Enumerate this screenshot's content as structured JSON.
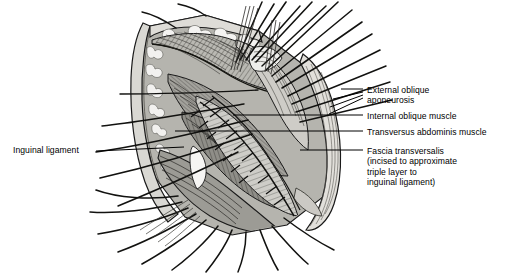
{
  "figure": {
    "kind": "medical-illustration",
    "background_color": "#ffffff",
    "line_color": "#1a1a1a",
    "tones": {
      "lightest": "#f0efed",
      "light": "#dededa",
      "mid_light": "#c6c5c0",
      "mid": "#aaa9a3",
      "mid_dark": "#8e8d87",
      "dark": "#6e6d68",
      "darkest": "#4a4945"
    }
  },
  "labels": {
    "external_oblique": {
      "line1": "External oblique",
      "line2": "aponeurosis",
      "text": "External oblique\naponeurosis"
    },
    "internal_oblique": {
      "text": "Internal oblique muscle"
    },
    "transversus": {
      "text": "Transversus abdominis muscle"
    },
    "fascia_transversalis": {
      "line1": "Fascia transversalis",
      "line2": "(incised to approximate",
      "line3": "triple layer to",
      "line4": "inguinal ligament)",
      "text": "Fascia transversalis\n(incised to approximate\ntriple layer to\ninguinal ligament)"
    },
    "inguinal_ligament": {
      "text": "Inguinal ligament"
    }
  },
  "leader_lines": {
    "external_oblique_fan": [
      {
        "x1": 341,
        "y1": 89,
        "x2": 363,
        "y2": 89
      },
      {
        "x1": 333,
        "y1": 99,
        "x2": 363,
        "y2": 92
      },
      {
        "x1": 330,
        "y1": 107,
        "x2": 363,
        "y2": 95
      },
      {
        "x1": 329,
        "y1": 114,
        "x2": 363,
        "y2": 98
      }
    ],
    "internal_oblique": {
      "x1": 233,
      "y1": 115,
      "x2": 363,
      "y2": 115
    },
    "transversus": {
      "x1": 175,
      "y1": 131,
      "x2": 363,
      "y2": 131
    },
    "fascia_transversalis": {
      "x1": 300,
      "y1": 150,
      "x2": 363,
      "y2": 150
    },
    "inguinal_ligament": {
      "x1": 96,
      "y1": 151,
      "x2": 184,
      "y2": 147
    }
  }
}
